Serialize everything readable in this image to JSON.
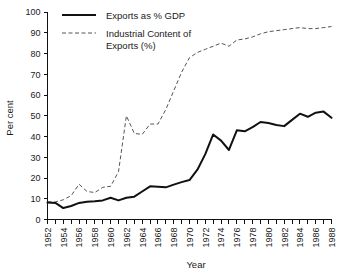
{
  "chart_data": {
    "type": "line",
    "title": "",
    "xlabel": "Year",
    "ylabel": "Per cent",
    "xlim": [
      1952,
      1988
    ],
    "ylim": [
      0,
      100
    ],
    "grid": false,
    "legend_position": "top-left-inside",
    "y_ticks": [
      0,
      10,
      20,
      30,
      40,
      50,
      60,
      70,
      80,
      90,
      100
    ],
    "y_tick_labels": [
      "0",
      "10",
      "20",
      "30",
      "40",
      "50",
      "60",
      "70",
      "80",
      "90",
      "100"
    ],
    "x_ticks_minor_step": 1,
    "x_ticks": [
      1952,
      1954,
      1956,
      1958,
      1960,
      1962,
      1964,
      1966,
      1968,
      1970,
      1972,
      1974,
      1976,
      1978,
      1980,
      1982,
      1984,
      1986,
      1988
    ],
    "x_tick_labels": [
      "1952",
      "1954",
      "1956",
      "1958",
      "1960",
      "1962",
      "1964",
      "1966",
      "1968",
      "1970",
      "1972",
      "1974",
      "1976",
      "1978",
      "1980",
      "1982",
      "1984",
      "1986",
      "1988"
    ],
    "x": [
      1952,
      1953,
      1954,
      1955,
      1956,
      1957,
      1958,
      1959,
      1960,
      1961,
      1962,
      1963,
      1964,
      1965,
      1966,
      1967,
      1968,
      1969,
      1970,
      1971,
      1972,
      1973,
      1974,
      1975,
      1976,
      1977,
      1978,
      1979,
      1980,
      1981,
      1982,
      1983,
      1984,
      1985,
      1986,
      1987,
      1988
    ],
    "series": [
      {
        "name": "Exports as % GDP",
        "style": "solid",
        "color": "#111111",
        "values": [
          8.2,
          8.0,
          5.5,
          6.5,
          8.0,
          8.6,
          8.8,
          9.2,
          10.5,
          9.2,
          10.5,
          11.0,
          13.5,
          16.0,
          15.8,
          15.5,
          16.8,
          18.0,
          19.0,
          24.0,
          31.5,
          41.0,
          38.0,
          33.5,
          43.0,
          42.5,
          44.5,
          47.0,
          46.5,
          45.5,
          45.0,
          48.0,
          51.0,
          49.5,
          51.5,
          52.0,
          49.0
        ]
      },
      {
        "name": "Industrial Content of Exports (%)",
        "style": "dashed",
        "color": "#555555",
        "values": [
          8.5,
          8.5,
          9.5,
          11.5,
          17.0,
          13.5,
          13.0,
          15.5,
          16.0,
          23.0,
          50.0,
          41.5,
          41.0,
          46.0,
          46.0,
          53.0,
          62.0,
          71.0,
          78.0,
          80.5,
          82.0,
          83.5,
          85.0,
          83.5,
          86.5,
          87.0,
          88.0,
          89.5,
          90.5,
          91.0,
          91.5,
          92.0,
          92.5,
          92.0,
          92.0,
          92.5,
          93.0
        ]
      }
    ],
    "legend": [
      {
        "label": "Exports as % GDP",
        "style": "solid"
      },
      {
        "label": "Industrial Content of",
        "label2": "Exports (%)",
        "style": "dashed"
      }
    ]
  },
  "legend": {
    "item1_line1": "Exports as % GDP",
    "item2_line1": "Industrial Content of",
    "item2_line2": "Exports (%)"
  },
  "axes": {
    "y_title": "Per cent",
    "x_title": "Year"
  }
}
